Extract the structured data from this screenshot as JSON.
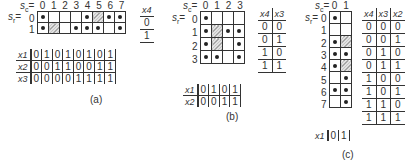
{
  "panel_a": {
    "caption": "(a)",
    "sc_label": "sc=",
    "sr_label": "sr=",
    "col_labels": [
      "0",
      "1",
      "2",
      "3",
      "4",
      "5",
      "6",
      "7"
    ],
    "row_labels": [
      "0",
      "1"
    ],
    "cells": [
      [
        "dot",
        "",
        "",
        "",
        "dot",
        "hatch",
        "dot",
        "dot"
      ],
      [
        "dot",
        "hatch",
        "",
        "dot",
        "dot",
        "dot",
        "",
        "dot"
      ]
    ],
    "x4_table": {
      "header": "x4",
      "values": [
        "0",
        "1"
      ]
    },
    "input_table": [
      {
        "name": "x1",
        "values": [
          "0",
          "1",
          "0",
          "1",
          "0",
          "1",
          "0",
          "1"
        ]
      },
      {
        "name": "x2",
        "values": [
          "0",
          "0",
          "1",
          "1",
          "0",
          "0",
          "1",
          "1"
        ]
      },
      {
        "name": "x3",
        "values": [
          "0",
          "0",
          "0",
          "0",
          "1",
          "1",
          "1",
          "1"
        ]
      }
    ]
  },
  "panel_b": {
    "caption": "(b)",
    "sc_label": "sc=",
    "sr_label": "sr=",
    "col_labels": [
      "0",
      "1",
      "2",
      "3"
    ],
    "row_labels": [
      "0",
      "1",
      "2",
      "3"
    ],
    "cells": [
      [
        "dot",
        "",
        "",
        ""
      ],
      [
        "dot",
        "hatch",
        "dot",
        "dot"
      ],
      [
        "dot",
        "hatch",
        "",
        "dot"
      ],
      [
        "dot",
        "dot",
        "",
        "dot"
      ]
    ],
    "x4x3_table": {
      "headers": [
        "x4",
        "x3"
      ],
      "rows": [
        [
          "0",
          "0"
        ],
        [
          "0",
          "1"
        ],
        [
          "1",
          "0"
        ],
        [
          "1",
          "1"
        ]
      ]
    },
    "input_table": [
      {
        "name": "x1",
        "values": [
          "0",
          "1",
          "0",
          "1"
        ]
      },
      {
        "name": "x2",
        "values": [
          "0",
          "0",
          "1",
          "1"
        ]
      }
    ]
  },
  "panel_c": {
    "caption": "(c)",
    "sc_label": "sc=",
    "sr_label": "sr=",
    "col_labels": [
      "0",
      "1"
    ],
    "row_labels": [
      "0",
      "1",
      "2",
      "3",
      "4",
      "5",
      "6",
      "7"
    ],
    "cells": [
      [
        "dot",
        ""
      ],
      [
        "",
        ""
      ],
      [
        "dot",
        "hatch"
      ],
      [
        "dot",
        "dot"
      ],
      [
        "dot",
        "hatch"
      ],
      [
        "",
        "dot"
      ],
      [
        "dot",
        "dot"
      ],
      [
        "",
        "dot"
      ]
    ],
    "x4x3x2_table": {
      "headers": [
        "x4",
        "x3",
        "x2"
      ],
      "rows": [
        [
          "0",
          "0",
          "0"
        ],
        [
          "0",
          "0",
          "1"
        ],
        [
          "0",
          "1",
          "0"
        ],
        [
          "0",
          "1",
          "1"
        ],
        [
          "1",
          "0",
          "0"
        ],
        [
          "1",
          "0",
          "1"
        ],
        [
          "1",
          "1",
          "0"
        ],
        [
          "1",
          "1",
          "1"
        ]
      ]
    },
    "input_table": [
      {
        "name": "x1",
        "values": [
          "0",
          "1"
        ]
      }
    ]
  }
}
